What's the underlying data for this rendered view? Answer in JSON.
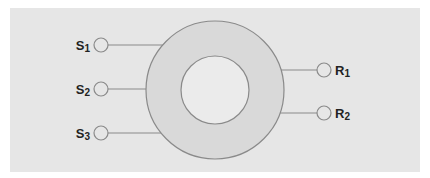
{
  "diagram": {
    "type": "ring-with-ports",
    "colors": {
      "panel": "#e6e6e6",
      "ring": "#d9d9d9",
      "inner": "#ebebeb",
      "stroke": "#8a8a8a",
      "port_fill": "#e6e6e6",
      "label": "#222222"
    },
    "ring": {
      "cx": 215,
      "cy": 90,
      "r_outer": 69,
      "r_inner": 34
    },
    "left_ports": [
      {
        "id": "S1",
        "base": "S",
        "sub": "1",
        "cx": 101,
        "cy": 45
      },
      {
        "id": "S2",
        "base": "S",
        "sub": "2",
        "cx": 101,
        "cy": 89
      },
      {
        "id": "S3",
        "base": "S",
        "sub": "3",
        "cx": 101,
        "cy": 133
      }
    ],
    "right_ports": [
      {
        "id": "R1",
        "base": "R",
        "sub": "1",
        "cx": 324,
        "cy": 70
      },
      {
        "id": "R2",
        "base": "R",
        "sub": "2",
        "cx": 324,
        "cy": 113
      }
    ]
  }
}
